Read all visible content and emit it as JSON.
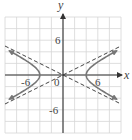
{
  "chart_data": {
    "type": "line",
    "title": "",
    "xlabel": "x",
    "ylabel": "y",
    "xlim": [
      -10,
      10
    ],
    "ylim": [
      -10,
      10
    ],
    "grid": true,
    "grid_step": 2,
    "tick_labels": {
      "x": [
        {
          "value": -6,
          "label": "-6"
        },
        {
          "value": 0,
          "label": "0"
        },
        {
          "value": 6,
          "label": "6"
        }
      ],
      "y": [
        {
          "value": 6,
          "label": "6"
        },
        {
          "value": -6,
          "label": "-6"
        }
      ]
    },
    "equation": "x^2/16 - y^2/4 = 1",
    "series": [
      {
        "name": "hyperbola-right-branch",
        "style": "solid",
        "vertex": [
          4,
          0
        ],
        "arrows": true
      },
      {
        "name": "hyperbola-left-branch",
        "style": "solid",
        "vertex": [
          -4,
          0
        ],
        "arrows": true
      },
      {
        "name": "asymptote-positive",
        "style": "dashed",
        "equation": "y = x/2"
      },
      {
        "name": "asymptote-negative",
        "style": "dashed",
        "equation": "y = -x/2"
      }
    ],
    "colors": {
      "grid": "#d6d6d6",
      "axis": "#333333",
      "curve": "#777777",
      "asymptote": "#444444"
    }
  },
  "labels": {
    "x_axis": "x",
    "y_axis": "y",
    "origin": "0",
    "x_neg": "-6",
    "x_pos": "6",
    "y_pos": "6",
    "y_neg": "-6"
  }
}
